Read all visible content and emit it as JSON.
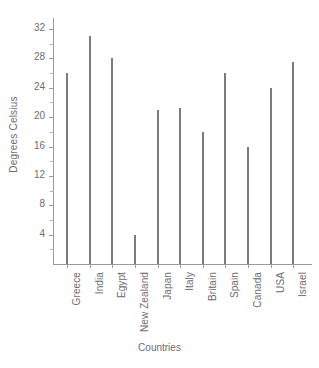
{
  "chart_data": {
    "type": "bar",
    "title": "",
    "subtitle": "",
    "xlabel": "Countries",
    "ylabel": "Degrees Celsius",
    "categories": [
      "Greece",
      "India",
      "Egypt",
      "New Zealand",
      "Japan",
      "Italy",
      "Britain",
      "Spain",
      "Canada",
      "USA",
      "Israel"
    ],
    "values": [
      26,
      31,
      28,
      4,
      21,
      21.3,
      18,
      26,
      16,
      24,
      27.5
    ],
    "ylim": [
      0,
      33.5
    ],
    "y_ticks": [
      4,
      8,
      12,
      16,
      20,
      24,
      28,
      32
    ],
    "y_minor_ticks": [
      2,
      6,
      10,
      14,
      18,
      22,
      26,
      30
    ],
    "y_tick_labels": [
      "4",
      "8",
      "12",
      "16",
      "20",
      "24",
      "28",
      "32"
    ],
    "grid": false,
    "legend": null,
    "series": [
      {
        "name": "Average temperature",
        "values": [
          26,
          31,
          28,
          4,
          21,
          21.3,
          18,
          26,
          16,
          24,
          27.5
        ]
      }
    ],
    "colors": {
      "bar": "#7c7c7c",
      "axis": "#9a9a9a",
      "text": "#6d6d6d",
      "background": "#ffffff"
    }
  }
}
